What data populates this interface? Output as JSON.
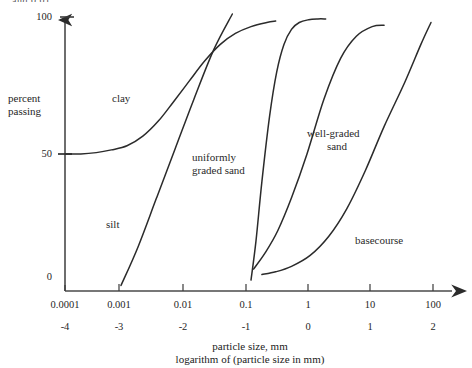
{
  "figure": {
    "clipped_header_text": "and 0.01",
    "y_axis": {
      "label_line1": "percent",
      "label_line2": "passing",
      "ticks": [
        "100",
        "50",
        "0"
      ]
    },
    "x_axis": {
      "tick_labels_top": [
        "0.0001",
        "0.001",
        "0.01",
        "0.1",
        "1",
        "10",
        "100"
      ],
      "tick_labels_bottom": [
        "-4",
        "-3",
        "-2",
        "-1",
        "0",
        "1",
        "2"
      ],
      "title_line1": "particle size, mm",
      "title_line2": "logarithm of (particle size in mm)"
    },
    "curve_labels": {
      "clay": "clay",
      "silt": "silt",
      "uniform_sand_line1": "uniformly",
      "uniform_sand_line2": "graded sand",
      "well_graded_line1": "well-graded",
      "well_graded_line2": "sand",
      "basecourse": "basecourse"
    }
  },
  "chart_data": {
    "type": "line",
    "title": "",
    "xlabel": "particle size, mm / logarithm of (particle size in mm)",
    "ylabel": "percent passing",
    "xlim": [
      0.0001,
      100
    ],
    "ylim": [
      0,
      100
    ],
    "x_scale": "log",
    "grid": false,
    "legend": "inline-annotations",
    "xticks": [
      0.0001,
      0.001,
      0.01,
      0.1,
      1,
      10,
      100
    ],
    "xtick_labels": [
      "0.0001",
      "0.001",
      "0.01",
      "0.1",
      "1",
      "10",
      "100"
    ],
    "xticks_log": [
      -4,
      -3,
      -2,
      -1,
      0,
      1,
      2
    ],
    "yticks": [
      0,
      50,
      100
    ],
    "series": [
      {
        "name": "clay",
        "x": [
          0.0001,
          0.00018,
          0.00032,
          0.00056,
          0.001,
          0.0018,
          0.0032,
          0.0056,
          0.01,
          0.018,
          0.032,
          0.056,
          0.1,
          0.18,
          0.25
        ],
        "values": [
          50,
          50,
          50.5,
          51.5,
          53,
          56.5,
          62,
          69,
          76.5,
          84,
          90,
          94,
          96.5,
          98,
          98.5
        ]
      },
      {
        "name": "silt",
        "x": [
          0.0008,
          0.0015,
          0.003,
          0.006,
          0.012,
          0.025,
          0.05
        ],
        "values": [
          2,
          16,
          34,
          52,
          70,
          88,
          104
        ]
      },
      {
        "name": "uniformly graded sand",
        "x": [
          0.1,
          0.12,
          0.15,
          0.2,
          0.26,
          0.34,
          0.45,
          0.6,
          0.85,
          1.2,
          1.6
        ],
        "values": [
          4,
          18,
          40,
          64,
          80,
          90,
          95.5,
          98,
          99,
          99.3,
          99.3
        ]
      },
      {
        "name": "well-graded sand",
        "x": [
          0.11,
          0.17,
          0.27,
          0.45,
          0.8,
          1.5,
          2.8,
          5.0,
          9.0,
          14.0
        ],
        "values": [
          8,
          14,
          22,
          34,
          50,
          70,
          85,
          93,
          96.5,
          97
        ]
      },
      {
        "name": "basecourse",
        "x": [
          0.15,
          0.25,
          0.45,
          0.9,
          1.8,
          3.5,
          7.0,
          14,
          30,
          55,
          80
        ],
        "values": [
          6,
          7,
          9,
          13,
          20,
          30,
          44,
          60,
          76,
          90,
          98
        ]
      }
    ],
    "annotations": [
      {
        "text": "clay",
        "x": 0.0035,
        "y": 74
      },
      {
        "text": "silt",
        "x": 0.0019,
        "y": 26
      },
      {
        "text": "uniformly graded sand",
        "x": 0.035,
        "y": 50
      },
      {
        "text": "well-graded sand",
        "x": 1.1,
        "y": 58
      },
      {
        "text": "basecourse",
        "x": 14,
        "y": 21
      }
    ]
  }
}
